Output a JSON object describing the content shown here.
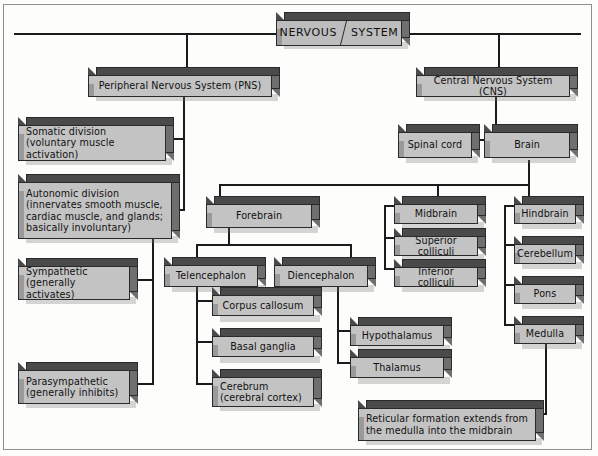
{
  "diagram": {
    "root": {
      "label_left": "NERVOUS",
      "label_right": "SYSTEM"
    },
    "nodes": [
      {
        "id": "pns",
        "label": "Peripheral Nervous System (PNS)"
      },
      {
        "id": "cns",
        "label": "Central Nervous System (CNS)"
      },
      {
        "id": "somatic",
        "label": "Somatic division\n(voluntary muscle activation)"
      },
      {
        "id": "autonomic",
        "label": "Autonomic division\n(innervates smooth muscle,\ncardiac muscle, and glands;\nbasically involuntary)"
      },
      {
        "id": "sympathetic",
        "label": "Sympathetic\n(generally activates)"
      },
      {
        "id": "parasympathetic",
        "label": "Parasympathetic\n(generally inhibits)"
      },
      {
        "id": "spinal-cord",
        "label": "Spinal cord"
      },
      {
        "id": "brain",
        "label": "Brain"
      },
      {
        "id": "forebrain",
        "label": "Forebrain"
      },
      {
        "id": "midbrain",
        "label": "Midbrain"
      },
      {
        "id": "hindbrain",
        "label": "Hindbrain"
      },
      {
        "id": "superior-colliculi",
        "label": "Superior colliculi"
      },
      {
        "id": "inferior-colliculi",
        "label": "Inferior colliculi"
      },
      {
        "id": "cerebellum",
        "label": "Cerebellum"
      },
      {
        "id": "pons",
        "label": "Pons"
      },
      {
        "id": "medulla",
        "label": "Medulla"
      },
      {
        "id": "telencephalon",
        "label": "Telencephalon"
      },
      {
        "id": "diencephalon",
        "label": "Diencephalon"
      },
      {
        "id": "corpus-callosum",
        "label": "Corpus callosum"
      },
      {
        "id": "basal-ganglia",
        "label": "Basal ganglia"
      },
      {
        "id": "cerebrum",
        "label": "Cerebrum\n(cerebral cortex)"
      },
      {
        "id": "hypothalamus",
        "label": "Hypothalamus"
      },
      {
        "id": "thalamus",
        "label": "Thalamus"
      },
      {
        "id": "reticular",
        "label": "Reticular formation extends from\nthe medulla into the midbrain"
      }
    ],
    "colors": {
      "box_face": "#c3c3c3",
      "box_top": "#4a4a4a",
      "box_side": "#6f6f6f",
      "line": "#1b1b1b",
      "border": "#2a2a2a",
      "background": "#fdfdfb"
    }
  }
}
